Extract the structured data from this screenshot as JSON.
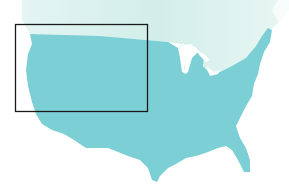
{
  "map": {
    "title": "Continental United States with highlighted northwest region",
    "regions": [
      {
        "name": "Canada",
        "color": "#d4efea"
      },
      {
        "name": "United States",
        "color": "#7dcfd6"
      }
    ],
    "highlight_box": {
      "label": "Selected region",
      "x": 15,
      "y": 24,
      "width": 133,
      "height": 88,
      "stroke": "#1a1a1a"
    }
  }
}
